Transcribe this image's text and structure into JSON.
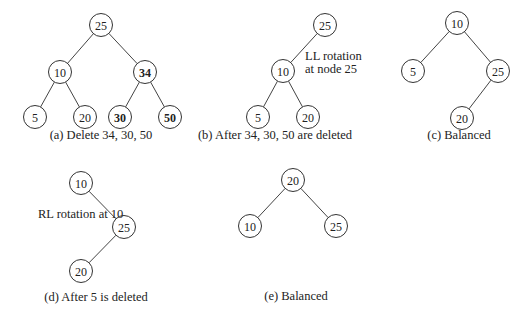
{
  "panels": [
    {
      "id": "a",
      "caption": "(a) Delete 34, 30, 50",
      "nodes": [
        {
          "label": "25",
          "x": 101,
          "y": 25,
          "bold": false
        },
        {
          "label": "10",
          "x": 60,
          "y": 72,
          "bold": false
        },
        {
          "label": "34",
          "x": 145,
          "y": 72,
          "bold": true
        },
        {
          "label": "5",
          "x": 35,
          "y": 117,
          "bold": false
        },
        {
          "label": "20",
          "x": 85,
          "y": 117,
          "bold": false
        },
        {
          "label": "30",
          "x": 120,
          "y": 117,
          "bold": true
        },
        {
          "label": "50",
          "x": 170,
          "y": 117,
          "bold": true
        }
      ],
      "edges": [
        [
          0,
          1
        ],
        [
          0,
          2
        ],
        [
          1,
          3
        ],
        [
          1,
          4
        ],
        [
          2,
          5
        ],
        [
          2,
          6
        ]
      ]
    },
    {
      "id": "b",
      "caption": "(b) After 34, 30, 50 are deleted",
      "note": [
        "LL rotation",
        "at node 25"
      ],
      "nodes": [
        {
          "label": "25",
          "x": 325,
          "y": 25
        },
        {
          "label": "10",
          "x": 283,
          "y": 71
        },
        {
          "label": "5",
          "x": 258,
          "y": 117
        },
        {
          "label": "20",
          "x": 308,
          "y": 117
        }
      ],
      "edges": [
        [
          0,
          1
        ],
        [
          1,
          2
        ],
        [
          1,
          3
        ]
      ]
    },
    {
      "id": "c",
      "caption": "(c) Balanced",
      "nodes": [
        {
          "label": "10",
          "x": 457,
          "y": 23
        },
        {
          "label": "5",
          "x": 413,
          "y": 71
        },
        {
          "label": "25",
          "x": 498,
          "y": 71
        },
        {
          "label": "20",
          "x": 462,
          "y": 118
        }
      ],
      "edges": [
        [
          0,
          1
        ],
        [
          0,
          2
        ],
        [
          2,
          3
        ]
      ]
    },
    {
      "id": "d",
      "caption": "(d) After 5 is deleted",
      "note": [
        "RL rotation at 10"
      ],
      "nodes": [
        {
          "label": "10",
          "x": 81,
          "y": 183
        },
        {
          "label": "25",
          "x": 124,
          "y": 227
        },
        {
          "label": "20",
          "x": 81,
          "y": 271
        }
      ],
      "edges": [
        [
          0,
          1
        ],
        [
          1,
          2
        ]
      ]
    },
    {
      "id": "e",
      "caption": "(e) Balanced",
      "nodes": [
        {
          "label": "20",
          "x": 293,
          "y": 180
        },
        {
          "label": "10",
          "x": 250,
          "y": 226
        },
        {
          "label": "25",
          "x": 336,
          "y": 226
        }
      ],
      "edges": [
        [
          0,
          1
        ],
        [
          0,
          2
        ]
      ]
    }
  ]
}
